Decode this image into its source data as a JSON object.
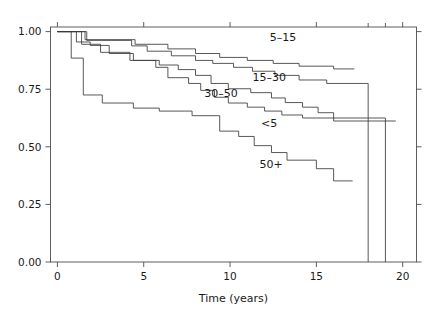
{
  "figure": {
    "background": "#ffffff",
    "line_color": "#3a3a3a",
    "axis_color": "#4d4d4d",
    "cropped_header_text": "— — — — —"
  },
  "chart_data": {
    "type": "line",
    "subtype": "kaplan-meier-step",
    "title": "",
    "subtitle": "",
    "xlabel": "Time (years)",
    "ylabel": "",
    "xlim": [
      -0.4,
      20.8
    ],
    "ylim": [
      0.0,
      1.02
    ],
    "grid": false,
    "legend_position": "inline-annotations",
    "x_ticks": [
      0,
      5,
      10,
      15,
      20
    ],
    "x_tick_labels": [
      "0",
      "5",
      "10",
      "15",
      "20"
    ],
    "x_minor_ticks": [
      18,
      19
    ],
    "y_ticks": [
      0.0,
      0.25,
      0.5,
      0.75,
      1.0
    ],
    "y_tick_labels": [
      "0.00",
      "0.25",
      "0.50",
      "0.75",
      "1.00"
    ],
    "annotations": [
      {
        "text": "5–15",
        "x": 12.3,
        "y": 0.975
      },
      {
        "text": "15–30",
        "x": 11.3,
        "y": 0.805
      },
      {
        "text": "30–50",
        "x": 8.5,
        "y": 0.735
      },
      {
        "text": "<5",
        "x": 11.8,
        "y": 0.605
      },
      {
        "text": "50+",
        "x": 11.7,
        "y": 0.425
      }
    ],
    "series": [
      {
        "name": "<5",
        "label": "<5",
        "points": [
          [
            0.0,
            1.0
          ],
          [
            1.1,
            1.0
          ],
          [
            1.1,
            0.955
          ],
          [
            1.9,
            0.955
          ],
          [
            1.9,
            0.94
          ],
          [
            3.0,
            0.94
          ],
          [
            3.0,
            0.905
          ],
          [
            4.4,
            0.905
          ],
          [
            4.4,
            0.875
          ],
          [
            5.7,
            0.875
          ],
          [
            5.7,
            0.845
          ],
          [
            6.4,
            0.845
          ],
          [
            6.4,
            0.8
          ],
          [
            7.6,
            0.8
          ],
          [
            7.6,
            0.775
          ],
          [
            8.3,
            0.775
          ],
          [
            8.3,
            0.745
          ],
          [
            9.1,
            0.745
          ],
          [
            9.1,
            0.715
          ],
          [
            9.9,
            0.715
          ],
          [
            9.9,
            0.69
          ],
          [
            11.0,
            0.69
          ],
          [
            11.0,
            0.672
          ],
          [
            12.0,
            0.672
          ],
          [
            12.0,
            0.655
          ],
          [
            13.0,
            0.655
          ],
          [
            13.0,
            0.638
          ],
          [
            14.2,
            0.638
          ],
          [
            14.2,
            0.625
          ],
          [
            16.0,
            0.625
          ],
          [
            16.0,
            0.612
          ],
          [
            19.6,
            0.612
          ]
        ]
      },
      {
        "name": "5-15",
        "label": "5–15",
        "points": [
          [
            0.0,
            1.0
          ],
          [
            1.6,
            1.0
          ],
          [
            1.6,
            0.965
          ],
          [
            4.5,
            0.965
          ],
          [
            4.5,
            0.945
          ],
          [
            6.4,
            0.945
          ],
          [
            6.4,
            0.925
          ],
          [
            8.0,
            0.925
          ],
          [
            8.0,
            0.905
          ],
          [
            9.4,
            0.905
          ],
          [
            9.4,
            0.888
          ],
          [
            11.0,
            0.888
          ],
          [
            11.0,
            0.875
          ],
          [
            12.5,
            0.875
          ],
          [
            12.5,
            0.862
          ],
          [
            14.0,
            0.862
          ],
          [
            14.0,
            0.85
          ],
          [
            16.0,
            0.85
          ],
          [
            16.0,
            0.838
          ],
          [
            17.2,
            0.838
          ]
        ]
      },
      {
        "name": "15-30",
        "label": "15–30",
        "points": [
          [
            0.0,
            1.0
          ],
          [
            1.7,
            1.0
          ],
          [
            1.7,
            0.962
          ],
          [
            4.3,
            0.962
          ],
          [
            4.3,
            0.938
          ],
          [
            5.2,
            0.938
          ],
          [
            5.2,
            0.915
          ],
          [
            6.6,
            0.915
          ],
          [
            6.6,
            0.895
          ],
          [
            8.0,
            0.895
          ],
          [
            8.0,
            0.875
          ],
          [
            9.0,
            0.875
          ],
          [
            9.0,
            0.862
          ],
          [
            10.2,
            0.862
          ],
          [
            10.2,
            0.845
          ],
          [
            11.3,
            0.845
          ],
          [
            11.3,
            0.828
          ],
          [
            12.6,
            0.828
          ],
          [
            12.6,
            0.81
          ],
          [
            14.0,
            0.81
          ],
          [
            14.0,
            0.79
          ],
          [
            15.6,
            0.79
          ],
          [
            15.6,
            0.775
          ],
          [
            18.0,
            0.775
          ],
          [
            18.0,
            0.0
          ]
        ]
      },
      {
        "name": "30-50",
        "label": "30–50",
        "points": [
          [
            0.0,
            1.0
          ],
          [
            1.4,
            1.0
          ],
          [
            1.4,
            0.945
          ],
          [
            2.5,
            0.945
          ],
          [
            2.5,
            0.91
          ],
          [
            4.2,
            0.91
          ],
          [
            4.2,
            0.875
          ],
          [
            5.9,
            0.875
          ],
          [
            5.9,
            0.855
          ],
          [
            7.0,
            0.855
          ],
          [
            7.0,
            0.835
          ],
          [
            8.0,
            0.835
          ],
          [
            8.0,
            0.81
          ],
          [
            8.9,
            0.81
          ],
          [
            8.9,
            0.775
          ],
          [
            9.9,
            0.775
          ],
          [
            9.9,
            0.752
          ],
          [
            11.2,
            0.752
          ],
          [
            11.2,
            0.735
          ],
          [
            12.4,
            0.735
          ],
          [
            12.4,
            0.712
          ],
          [
            13.2,
            0.712
          ],
          [
            13.2,
            0.692
          ],
          [
            14.2,
            0.692
          ],
          [
            14.2,
            0.672
          ],
          [
            15.1,
            0.672
          ],
          [
            15.1,
            0.648
          ],
          [
            16.0,
            0.648
          ],
          [
            16.0,
            0.625
          ],
          [
            19.0,
            0.625
          ],
          [
            19.0,
            0.0
          ]
        ]
      },
      {
        "name": "50+",
        "label": "50+",
        "points": [
          [
            0.0,
            1.0
          ],
          [
            0.8,
            1.0
          ],
          [
            0.8,
            0.885
          ],
          [
            1.5,
            0.885
          ],
          [
            1.5,
            0.725
          ],
          [
            2.6,
            0.725
          ],
          [
            2.6,
            0.69
          ],
          [
            4.4,
            0.69
          ],
          [
            4.4,
            0.668
          ],
          [
            5.9,
            0.668
          ],
          [
            5.9,
            0.655
          ],
          [
            7.8,
            0.655
          ],
          [
            7.8,
            0.635
          ],
          [
            9.4,
            0.635
          ],
          [
            9.4,
            0.568
          ],
          [
            10.5,
            0.568
          ],
          [
            10.5,
            0.545
          ],
          [
            11.4,
            0.545
          ],
          [
            11.4,
            0.505
          ],
          [
            12.4,
            0.505
          ],
          [
            12.4,
            0.475
          ],
          [
            13.3,
            0.475
          ],
          [
            13.3,
            0.442
          ],
          [
            15.0,
            0.442
          ],
          [
            15.0,
            0.405
          ],
          [
            16.0,
            0.405
          ],
          [
            16.0,
            0.352
          ],
          [
            17.1,
            0.352
          ]
        ]
      }
    ]
  }
}
